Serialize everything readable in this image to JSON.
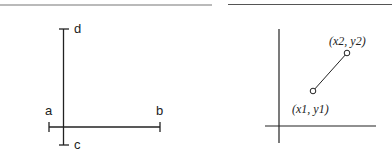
{
  "left_diagram": {
    "description": "Two perpendicular line segments with end ticks",
    "labels": {
      "a": "a",
      "b": "b",
      "c": "c",
      "d": "d"
    }
  },
  "right_diagram": {
    "description": "Line segment between two points on coordinate axes",
    "point1_label": "(x1, y1)",
    "point2_label": "(x2, y2)"
  },
  "colors": {
    "stroke": "#222222",
    "rule": "#666666",
    "background": "#ffffff"
  }
}
